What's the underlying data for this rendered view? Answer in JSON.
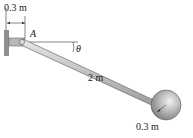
{
  "diagram": {
    "labels": {
      "wall_offset": "0.3 m",
      "pivot": "A",
      "angle": "θ",
      "rod_length": "2 m",
      "sphere_radius": "0.3 m"
    },
    "colors": {
      "rod": "#c8c8c8",
      "sphere": "#a9a9a9",
      "wall": "#9a9a9a",
      "line": "#333333"
    }
  }
}
